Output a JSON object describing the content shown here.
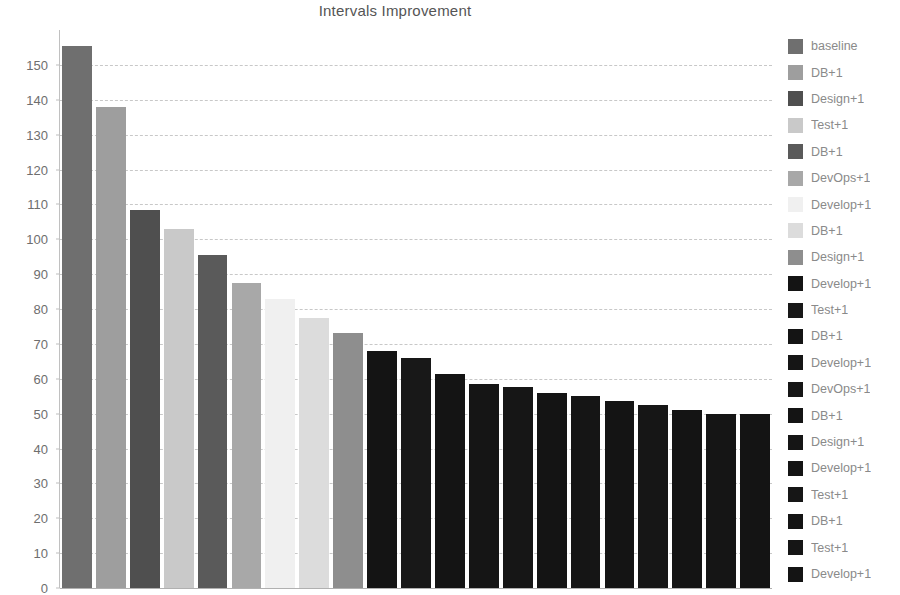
{
  "chart_data": {
    "type": "bar",
    "title": "Intervals Improvement",
    "xlabel": "",
    "ylabel": "",
    "ylim": [
      0,
      160
    ],
    "ytick_labels": [
      "0",
      "10",
      "20",
      "30",
      "40",
      "50",
      "60",
      "70",
      "80",
      "90",
      "100",
      "110",
      "120",
      "130",
      "140",
      "150"
    ],
    "ytick_values": [
      0,
      10,
      20,
      30,
      40,
      50,
      60,
      70,
      80,
      90,
      100,
      110,
      120,
      130,
      140,
      150
    ],
    "grid": true,
    "grid_axis": "y",
    "legend_position": "right",
    "categories": [
      "baseline",
      "DB+1",
      "Design+1",
      "Test+1",
      "DB+1",
      "DevOps+1",
      "Develop+1",
      "DB+1",
      "Design+1",
      "Develop+1",
      "Test+1",
      "DB+1",
      "Develop+1",
      "DevOps+1",
      "DB+1",
      "Design+1",
      "Develop+1",
      "Test+1",
      "DB+1",
      "Test+1",
      "Develop+1"
    ],
    "values": [
      155.5,
      138.0,
      108.5,
      103.0,
      95.5,
      87.5,
      83.0,
      77.5,
      73.0,
      68.0,
      66.0,
      61.5,
      58.5,
      57.5,
      56.0,
      55.0,
      53.5,
      52.5,
      51.0,
      50.0,
      50.0
    ],
    "colors": [
      "#6f6f6f",
      "#9e9e9e",
      "#4f4f4f",
      "#c9c9c9",
      "#5a5a5a",
      "#a8a8a8",
      "#f0f0f0",
      "#dcdcdc",
      "#8e8e8e",
      "#141414",
      "#181818",
      "#141414",
      "#151515",
      "#161616",
      "#141414",
      "#151515",
      "#141414",
      "#161616",
      "#141414",
      "#151515",
      "#141414"
    ]
  },
  "legend": {
    "items": [
      {
        "label": "baseline",
        "color": "#6f6f6f"
      },
      {
        "label": "DB+1",
        "color": "#9e9e9e"
      },
      {
        "label": "Design+1",
        "color": "#4f4f4f"
      },
      {
        "label": "Test+1",
        "color": "#c9c9c9"
      },
      {
        "label": "DB+1",
        "color": "#5a5a5a"
      },
      {
        "label": "DevOps+1",
        "color": "#a8a8a8"
      },
      {
        "label": "Develop+1",
        "color": "#f0f0f0"
      },
      {
        "label": "DB+1",
        "color": "#dcdcdc"
      },
      {
        "label": "Design+1",
        "color": "#8e8e8e"
      },
      {
        "label": "Develop+1",
        "color": "#141414"
      },
      {
        "label": "Test+1",
        "color": "#181818"
      },
      {
        "label": "DB+1",
        "color": "#141414"
      },
      {
        "label": "Develop+1",
        "color": "#151515"
      },
      {
        "label": "DevOps+1",
        "color": "#161616"
      },
      {
        "label": "DB+1",
        "color": "#141414"
      },
      {
        "label": "Design+1",
        "color": "#151515"
      },
      {
        "label": "Develop+1",
        "color": "#141414"
      },
      {
        "label": "Test+1",
        "color": "#161616"
      },
      {
        "label": "DB+1",
        "color": "#141414"
      },
      {
        "label": "Test+1",
        "color": "#151515"
      },
      {
        "label": "Develop+1",
        "color": "#141414"
      }
    ]
  }
}
